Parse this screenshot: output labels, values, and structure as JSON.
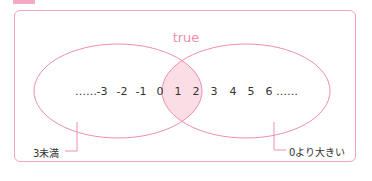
{
  "diagram": {
    "title_label": "true",
    "left_set_label": "3未満",
    "right_set_label": "0より大きい",
    "numbers": [
      {
        "text": "……",
        "x": 86
      },
      {
        "text": "-3",
        "x": 102
      },
      {
        "text": "-2",
        "x": 122
      },
      {
        "text": "-1",
        "x": 141
      },
      {
        "text": "0",
        "x": 160
      },
      {
        "text": "1",
        "x": 178
      },
      {
        "text": "2",
        "x": 196
      },
      {
        "text": "3",
        "x": 214
      },
      {
        "text": "4",
        "x": 233
      },
      {
        "text": "5",
        "x": 251
      },
      {
        "text": "6",
        "x": 269
      },
      {
        "text": "……",
        "x": 287
      }
    ],
    "colors": {
      "outline": "#ee8fab",
      "intersection_fill": "#fbdde6",
      "frame": "#f1a6bd",
      "tab": "#f3a9c0",
      "text": "#333333"
    }
  }
}
